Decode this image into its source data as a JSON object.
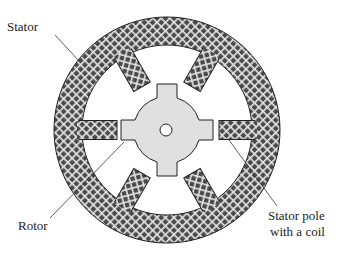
{
  "diagram": {
    "type": "stepper-motor-cross-section",
    "labels": {
      "stator": "Stator",
      "rotor": "Rotor",
      "stator_pole_line1": "Stator pole",
      "stator_pole_line2": "with a coil"
    },
    "geometry": {
      "center": [
        167,
        130
      ],
      "stator_outer_radius": 113,
      "stator_inner_radius": 85,
      "stator_pole_count": 6,
      "stator_pole_angles_deg": [
        0,
        60,
        120,
        180,
        240,
        300
      ],
      "rotor_radius": 36,
      "rotor_tooth_count": 4,
      "rotor_hole_radius": 6
    },
    "colors": {
      "stator_fill": "#555555",
      "stator_hatch": "#e8e8e8",
      "rotor_fill": "#e0e0e0",
      "outline": "#222222",
      "background": "#ffffff"
    }
  }
}
